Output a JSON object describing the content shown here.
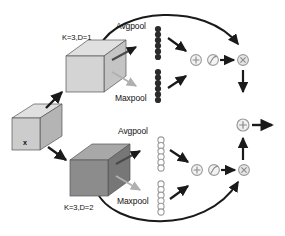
{
  "figure": {
    "type": "neural-network-block-diagram"
  },
  "colors": {
    "cube_light_front": "#cccccc",
    "cube_light_top": "#e0e0e0",
    "cube_light_side": "#b4b4b4",
    "cube_dark_front": "#8c8c8c",
    "cube_dark_top": "#a8a8a8",
    "cube_dark_side": "#777777",
    "stroke_dark": "#1a1a1a",
    "stroke_light": "#b0b0b0",
    "dot_filled": "#2b2b2b",
    "dot_hollow_stroke": "#9a9a9a",
    "op_circle_stroke": "#9a9a9a",
    "background": "#ffffff"
  },
  "input": {
    "label": "x",
    "name": "input-feature-cube"
  },
  "branches": [
    {
      "id": "top",
      "kernel_label": "K=3,D=1",
      "kernel_position": "above",
      "cube_shade": "light",
      "pools": [
        {
          "label": "Avgpool",
          "arrow": "dark",
          "dots": 6,
          "dot_style": "filled"
        },
        {
          "label": "Maxpool",
          "arrow": "light",
          "dots": 6,
          "dot_style": "filled"
        }
      ],
      "ops": [
        {
          "symbol": "+",
          "name": "add"
        },
        {
          "symbol": "sigmoid",
          "name": "sigmoid"
        },
        {
          "symbol": "×",
          "name": "multiply"
        }
      ],
      "skip_arrow": "curved-over-top"
    },
    {
      "id": "bottom",
      "kernel_label": "K=3,D=2",
      "kernel_position": "below",
      "cube_shade": "dark",
      "pools": [
        {
          "label": "Avgpool",
          "arrow": "dark",
          "dots": 6,
          "dot_style": "hollow"
        },
        {
          "label": "Maxpool",
          "arrow": "light",
          "dots": 6,
          "dot_style": "hollow"
        }
      ],
      "ops": [
        {
          "symbol": "+",
          "name": "add"
        },
        {
          "symbol": "sigmoid",
          "name": "sigmoid"
        },
        {
          "symbol": "×",
          "name": "multiply"
        }
      ],
      "skip_arrow": "curved-under-bottom"
    }
  ],
  "fusion": {
    "symbol": "+",
    "name": "fusion-add",
    "output_arrow": "right"
  }
}
